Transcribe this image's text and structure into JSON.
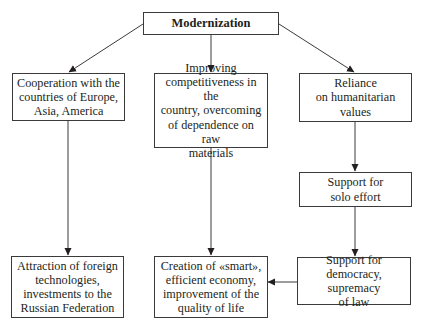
{
  "diagram": {
    "type": "flowchart",
    "colors": {
      "line": "#3a3a3a",
      "box_border": "#3a3a3a",
      "text": "#231f20",
      "background": "#ffffff"
    },
    "nodes": {
      "root": {
        "id": "modernization",
        "label": "Modernization"
      },
      "col1_top": {
        "id": "cooperation",
        "label": "Cooperation with the\ncountries of Europe,\nAsia, America"
      },
      "col2_top": {
        "id": "competitiveness",
        "label": "Improving\ncompetitiveness in the\ncountry, overcoming\nof dependence on raw\nmaterials"
      },
      "col3_top": {
        "id": "humanitarian",
        "label": "Reliance\non humanitarian\nvalues"
      },
      "col3_mid": {
        "id": "solo-effort",
        "label": "Support for\nsolo effort"
      },
      "col1_bottom": {
        "id": "attraction",
        "label": "Attraction of foreign\ntechnologies,\ninvestments to the\nRussian Federation"
      },
      "col2_bottom": {
        "id": "smart-economy",
        "label": "Creation of «smart»,\nefficient economy,\nimprovement of the\nquality of life"
      },
      "col3_bottom": {
        "id": "democracy",
        "label": "Support for\ndemocracy, supremacy\nof law"
      }
    },
    "edges": [
      {
        "from": "modernization",
        "to": "cooperation"
      },
      {
        "from": "modernization",
        "to": "competitiveness"
      },
      {
        "from": "modernization",
        "to": "humanitarian"
      },
      {
        "from": "cooperation",
        "to": "attraction"
      },
      {
        "from": "competitiveness",
        "to": "smart-economy"
      },
      {
        "from": "humanitarian",
        "to": "solo-effort"
      },
      {
        "from": "solo-effort",
        "to": "democracy"
      },
      {
        "from": "democracy",
        "to": "smart-economy"
      }
    ]
  }
}
